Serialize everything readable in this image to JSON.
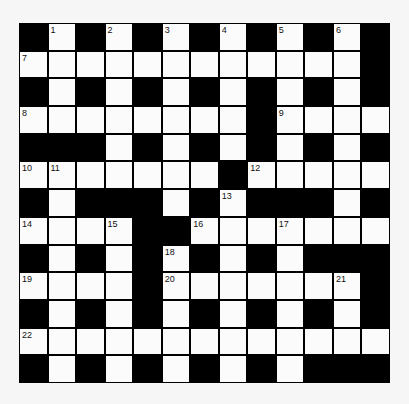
{
  "puzzle": {
    "type": "crossword",
    "rows": 13,
    "cols": 13,
    "colors": {
      "block": "#000000",
      "open": "#fbfbfb",
      "background": "#f6f6f6",
      "number": "#111111"
    },
    "grid": [
      "#.#.#.#.#.#.#",
      "............#",
      "#.#.#.#.#.#.#",
      "........#....",
      "###.#.#.#.#.#",
      ".......#.....",
      "#.###.#.###.#",
      "....##.......",
      "#.#.#.#.#.###",
      "....#.......#",
      "#.#.#.#.#.#.#",
      ".............",
      "#.#.#.#.#.###"
    ],
    "numbers": [
      {
        "row": 0,
        "col": 1,
        "n": "1"
      },
      {
        "row": 0,
        "col": 3,
        "n": "2"
      },
      {
        "row": 0,
        "col": 5,
        "n": "3"
      },
      {
        "row": 0,
        "col": 7,
        "n": "4"
      },
      {
        "row": 0,
        "col": 9,
        "n": "5"
      },
      {
        "row": 0,
        "col": 11,
        "n": "6"
      },
      {
        "row": 1,
        "col": 0,
        "n": "7"
      },
      {
        "row": 3,
        "col": 0,
        "n": "8"
      },
      {
        "row": 3,
        "col": 9,
        "n": "9"
      },
      {
        "row": 5,
        "col": 0,
        "n": "10"
      },
      {
        "row": 5,
        "col": 1,
        "n": "11"
      },
      {
        "row": 5,
        "col": 8,
        "n": "12"
      },
      {
        "row": 6,
        "col": 7,
        "n": "13"
      },
      {
        "row": 7,
        "col": 0,
        "n": "14"
      },
      {
        "row": 7,
        "col": 3,
        "n": "15"
      },
      {
        "row": 7,
        "col": 6,
        "n": "16"
      },
      {
        "row": 7,
        "col": 9,
        "n": "17"
      },
      {
        "row": 8,
        "col": 5,
        "n": "18"
      },
      {
        "row": 9,
        "col": 0,
        "n": "19"
      },
      {
        "row": 9,
        "col": 5,
        "n": "20"
      },
      {
        "row": 9,
        "col": 11,
        "n": "21"
      },
      {
        "row": 11,
        "col": 0,
        "n": "22"
      }
    ]
  }
}
